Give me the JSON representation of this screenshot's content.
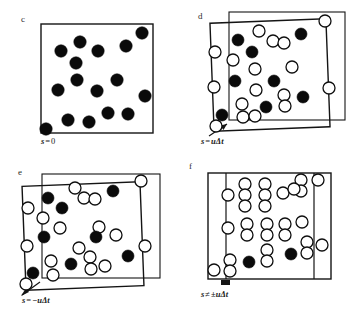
{
  "figure": {
    "background": "#ffffff",
    "ink": "#141414",
    "panel_count": 4
  },
  "panels": [
    {
      "id": "panel-c",
      "letter": "c",
      "caption": {
        "symbol": "s",
        "operator": "=",
        "value": "0"
      },
      "caption_text": "s = 0",
      "frames": [
        {
          "name": "primary",
          "x": 41,
          "y": 24,
          "w": 112,
          "h": 109,
          "rotation": 0
        }
      ],
      "arrow": null,
      "dots": [
        {
          "cx": 142,
          "cy": 33,
          "r": 6.2,
          "type": "filled"
        },
        {
          "cx": 80,
          "cy": 42,
          "r": 6.2,
          "type": "filled"
        },
        {
          "cx": 126,
          "cy": 46,
          "r": 6.2,
          "type": "filled"
        },
        {
          "cx": 61,
          "cy": 51,
          "r": 6.2,
          "type": "filled"
        },
        {
          "cx": 98,
          "cy": 51,
          "r": 6.2,
          "type": "filled"
        },
        {
          "cx": 76,
          "cy": 63,
          "r": 6.2,
          "type": "filled"
        },
        {
          "cx": 77,
          "cy": 80,
          "r": 6.2,
          "type": "filled"
        },
        {
          "cx": 117,
          "cy": 80,
          "r": 6.2,
          "type": "filled"
        },
        {
          "cx": 58,
          "cy": 90,
          "r": 6.2,
          "type": "filled"
        },
        {
          "cx": 97,
          "cy": 91,
          "r": 6.2,
          "type": "filled"
        },
        {
          "cx": 145,
          "cy": 96,
          "r": 6.2,
          "type": "filled"
        },
        {
          "cx": 108,
          "cy": 113,
          "r": 6.2,
          "type": "filled"
        },
        {
          "cx": 128,
          "cy": 114,
          "r": 6.2,
          "type": "filled"
        },
        {
          "cx": 68,
          "cy": 120,
          "r": 6.2,
          "type": "filled"
        },
        {
          "cx": 89,
          "cy": 122,
          "r": 6.2,
          "type": "filled"
        },
        {
          "cx": 46,
          "cy": 129,
          "r": 6.2,
          "type": "filled"
        }
      ]
    },
    {
      "id": "panel-d",
      "letter": "d",
      "caption": {
        "symbol": "s",
        "operator": "=",
        "value": "uΔt"
      },
      "caption_text": "s = uΔt",
      "frames": [
        {
          "name": "shifted",
          "x": 31,
          "y": 21,
          "w": 116,
          "h": 108,
          "rotation": -2.2
        },
        {
          "name": "primary",
          "x": 48,
          "y": 12,
          "w": 116,
          "h": 108,
          "rotation": 0
        }
      ],
      "arrow": {
        "x1": 28,
        "y1": 136,
        "x2": 48,
        "y2": 124
      },
      "dots": [
        {
          "cx": 144,
          "cy": 21,
          "r": 6.0,
          "type": "open"
        },
        {
          "cx": 120,
          "cy": 34,
          "r": 6.0,
          "type": "filled"
        },
        {
          "cx": 78,
          "cy": 31,
          "r": 6.0,
          "type": "open"
        },
        {
          "cx": 57,
          "cy": 40,
          "r": 6.0,
          "type": "filled"
        },
        {
          "cx": 92,
          "cy": 41,
          "r": 6.0,
          "type": "open"
        },
        {
          "cx": 103,
          "cy": 43,
          "r": 6.0,
          "type": "open"
        },
        {
          "cx": 34,
          "cy": 52,
          "r": 6.0,
          "type": "open"
        },
        {
          "cx": 71,
          "cy": 52,
          "r": 6.0,
          "type": "filled"
        },
        {
          "cx": 52,
          "cy": 60,
          "r": 6.0,
          "type": "open"
        },
        {
          "cx": 74,
          "cy": 69,
          "r": 6.0,
          "type": "open"
        },
        {
          "cx": 111,
          "cy": 67,
          "r": 6.0,
          "type": "open"
        },
        {
          "cx": 54,
          "cy": 81,
          "r": 6.0,
          "type": "filled"
        },
        {
          "cx": 93,
          "cy": 81,
          "r": 6.0,
          "type": "filled"
        },
        {
          "cx": 33,
          "cy": 87,
          "r": 6.0,
          "type": "open"
        },
        {
          "cx": 75,
          "cy": 90,
          "r": 6.0,
          "type": "open"
        },
        {
          "cx": 103,
          "cy": 95,
          "r": 6.0,
          "type": "open"
        },
        {
          "cx": 122,
          "cy": 97,
          "r": 6.0,
          "type": "filled"
        },
        {
          "cx": 148,
          "cy": 88,
          "r": 6.0,
          "type": "open"
        },
        {
          "cx": 61,
          "cy": 104,
          "r": 6.0,
          "type": "open"
        },
        {
          "cx": 85,
          "cy": 107,
          "r": 6.0,
          "type": "filled"
        },
        {
          "cx": 104,
          "cy": 106,
          "r": 6.0,
          "type": "open"
        },
        {
          "cx": 41,
          "cy": 115,
          "r": 6.0,
          "type": "filled"
        },
        {
          "cx": 62,
          "cy": 117,
          "r": 6.0,
          "type": "open"
        },
        {
          "cx": 74,
          "cy": 116,
          "r": 6.0,
          "type": "open"
        },
        {
          "cx": 35,
          "cy": 126,
          "r": 6.0,
          "type": "open"
        }
      ]
    },
    {
      "id": "panel-e",
      "letter": "e",
      "caption": {
        "symbol": "s",
        "operator": "=",
        "value": "−uΔt"
      },
      "caption_text": "s = −uΔt",
      "frames": [
        {
          "name": "shifted",
          "x": 24,
          "y": 28,
          "w": 118,
          "h": 104,
          "rotation": -2.2
        },
        {
          "name": "primary",
          "x": 42,
          "y": 18,
          "w": 118,
          "h": 104,
          "rotation": 0
        }
      ],
      "arrow": {
        "x1": 22,
        "y1": 138,
        "x2": 40,
        "y2": 126
      },
      "dots": [
        {
          "cx": 141,
          "cy": 25,
          "r": 6.0,
          "type": "open"
        },
        {
          "cx": 113,
          "cy": 35,
          "r": 6.0,
          "type": "filled"
        },
        {
          "cx": 75,
          "cy": 32,
          "r": 6.0,
          "type": "open"
        },
        {
          "cx": 48,
          "cy": 42,
          "r": 6.0,
          "type": "filled"
        },
        {
          "cx": 84,
          "cy": 42,
          "r": 6.0,
          "type": "open"
        },
        {
          "cx": 95,
          "cy": 43,
          "r": 6.0,
          "type": "open"
        },
        {
          "cx": 28,
          "cy": 52,
          "r": 6.0,
          "type": "open"
        },
        {
          "cx": 62,
          "cy": 52,
          "r": 6.0,
          "type": "filled"
        },
        {
          "cx": 43,
          "cy": 62,
          "r": 6.0,
          "type": "open"
        },
        {
          "cx": 60,
          "cy": 72,
          "r": 6.0,
          "type": "open"
        },
        {
          "cx": 99,
          "cy": 71,
          "r": 6.0,
          "type": "open"
        },
        {
          "cx": 44,
          "cy": 81,
          "r": 6.0,
          "type": "filled"
        },
        {
          "cx": 96,
          "cy": 81,
          "r": 6.0,
          "type": "filled"
        },
        {
          "cx": 27,
          "cy": 90,
          "r": 6.0,
          "type": "open"
        },
        {
          "cx": 116,
          "cy": 79,
          "r": 6.0,
          "type": "open"
        },
        {
          "cx": 79,
          "cy": 92,
          "r": 6.0,
          "type": "open"
        },
        {
          "cx": 90,
          "cy": 101,
          "r": 6.0,
          "type": "open"
        },
        {
          "cx": 128,
          "cy": 100,
          "r": 6.0,
          "type": "filled"
        },
        {
          "cx": 145,
          "cy": 90,
          "r": 6.0,
          "type": "open"
        },
        {
          "cx": 51,
          "cy": 105,
          "r": 6.0,
          "type": "open"
        },
        {
          "cx": 71,
          "cy": 108,
          "r": 6.0,
          "type": "filled"
        },
        {
          "cx": 91,
          "cy": 113,
          "r": 6.0,
          "type": "open"
        },
        {
          "cx": 105,
          "cy": 110,
          "r": 6.0,
          "type": "open"
        },
        {
          "cx": 33,
          "cy": 117,
          "r": 6.0,
          "type": "filled"
        },
        {
          "cx": 53,
          "cy": 119,
          "r": 6.0,
          "type": "open"
        },
        {
          "cx": 26,
          "cy": 128,
          "r": 6.0,
          "type": "open"
        }
      ]
    },
    {
      "id": "panel-f",
      "letter": "f",
      "caption": {
        "symbol": "s",
        "operator": "≠",
        "value": "±uΔt"
      },
      "caption_text": "s ≠ ±uΔt",
      "frames": [
        {
          "name": "primary",
          "x": 27,
          "y": 17,
          "w": 123,
          "h": 106,
          "rotation": 0
        }
      ],
      "verticals": [
        {
          "x": 45,
          "y1": 17,
          "y2": 123
        },
        {
          "x": 133,
          "y1": 17,
          "y2": 123
        }
      ],
      "arrow": {
        "x1": 40,
        "y1": 126,
        "x2": 48,
        "y2": 126
      },
      "dots": [
        {
          "cx": 137,
          "cy": 24,
          "r": 6.0,
          "type": "open"
        },
        {
          "cx": 120,
          "cy": 24,
          "r": 6.0,
          "type": "open"
        },
        {
          "cx": 120,
          "cy": 35,
          "r": 6.0,
          "type": "open"
        },
        {
          "cx": 64,
          "cy": 28,
          "r": 6.0,
          "type": "open"
        },
        {
          "cx": 64,
          "cy": 39,
          "r": 6.0,
          "type": "open"
        },
        {
          "cx": 64,
          "cy": 50,
          "r": 6.0,
          "type": "open"
        },
        {
          "cx": 84,
          "cy": 28,
          "r": 6.0,
          "type": "open"
        },
        {
          "cx": 84,
          "cy": 39,
          "r": 6.0,
          "type": "open"
        },
        {
          "cx": 84,
          "cy": 50,
          "r": 6.0,
          "type": "open"
        },
        {
          "cx": 47,
          "cy": 39,
          "r": 6.0,
          "type": "open"
        },
        {
          "cx": 102,
          "cy": 37,
          "r": 6.0,
          "type": "open"
        },
        {
          "cx": 113,
          "cy": 33,
          "r": 6.0,
          "type": "open"
        },
        {
          "cx": 66,
          "cy": 68,
          "r": 6.0,
          "type": "open"
        },
        {
          "cx": 66,
          "cy": 79,
          "r": 6.0,
          "type": "open"
        },
        {
          "cx": 86,
          "cy": 68,
          "r": 6.0,
          "type": "open"
        },
        {
          "cx": 86,
          "cy": 79,
          "r": 6.0,
          "type": "open"
        },
        {
          "cx": 104,
          "cy": 68,
          "r": 6.0,
          "type": "open"
        },
        {
          "cx": 104,
          "cy": 79,
          "r": 6.0,
          "type": "open"
        },
        {
          "cx": 47,
          "cy": 72,
          "r": 6.0,
          "type": "open"
        },
        {
          "cx": 121,
          "cy": 66,
          "r": 6.0,
          "type": "open"
        },
        {
          "cx": 126,
          "cy": 86,
          "r": 6.0,
          "type": "open"
        },
        {
          "cx": 126,
          "cy": 97,
          "r": 6.0,
          "type": "open"
        },
        {
          "cx": 141,
          "cy": 89,
          "r": 6.0,
          "type": "open"
        },
        {
          "cx": 86,
          "cy": 94,
          "r": 6.0,
          "type": "open"
        },
        {
          "cx": 86,
          "cy": 105,
          "r": 6.0,
          "type": "open"
        },
        {
          "cx": 110,
          "cy": 98,
          "r": 6.0,
          "type": "filled"
        },
        {
          "cx": 68,
          "cy": 106,
          "r": 6.0,
          "type": "filled"
        },
        {
          "cx": 49,
          "cy": 104,
          "r": 6.0,
          "type": "open"
        },
        {
          "cx": 49,
          "cy": 115,
          "r": 6.0,
          "type": "open"
        },
        {
          "cx": 33,
          "cy": 114,
          "r": 6.0,
          "type": "open"
        }
      ]
    }
  ]
}
